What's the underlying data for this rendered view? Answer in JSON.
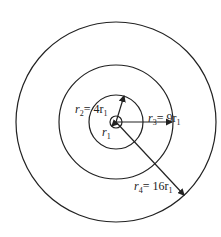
{
  "diagram": {
    "center": {
      "x": 116,
      "y": 122
    },
    "stroke_color": "#222222",
    "circles": [
      {
        "name": "r1",
        "radius_px": 6
      },
      {
        "name": "r2",
        "radius_px": 27
      },
      {
        "name": "r3",
        "radius_px": 57
      },
      {
        "name": "r4",
        "radius_px": 100
      }
    ],
    "labels": {
      "r1": {
        "var": "r",
        "sub": "1",
        "eq": ""
      },
      "r2": {
        "var": "r",
        "sub": "2",
        "eq": "= 4r",
        "eq_sub": "1"
      },
      "r3": {
        "var": "r",
        "sub": "3",
        "eq": "= 9r",
        "eq_sub": "1"
      },
      "r4": {
        "var": "r",
        "sub": "4",
        "eq": "= 16r",
        "eq_sub": "1"
      }
    }
  }
}
